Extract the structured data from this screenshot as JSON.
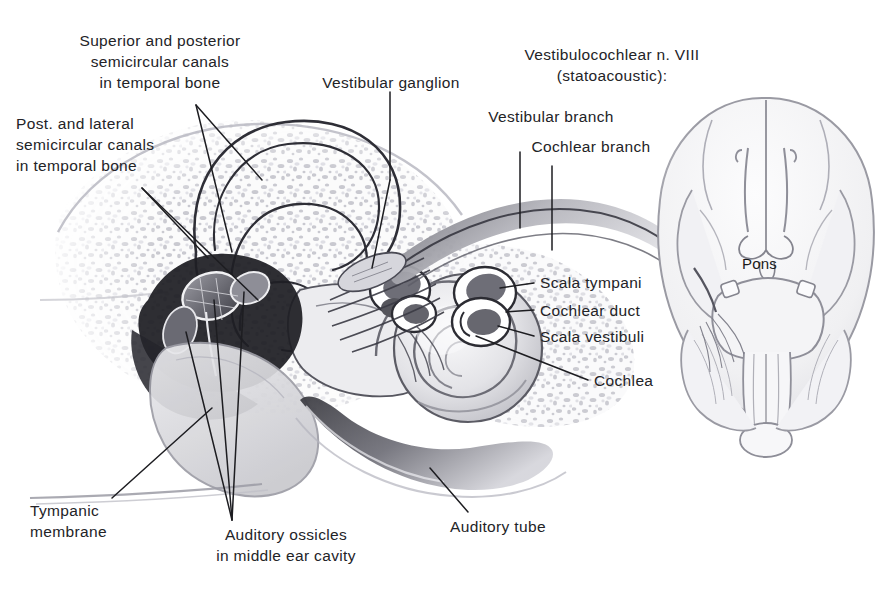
{
  "figure": {
    "background_color": "#ffffff",
    "ink_color": "#232327",
    "line_color": "#1d1d21"
  },
  "labels": {
    "superior_posterior_canals": "Superior and posterior\nsemicircular canals\nin temporal bone",
    "post_lateral_canals": "Post. and lateral\nsemicircular canals\nin temporal bone",
    "vestibular_ganglion": "Vestibular ganglion",
    "nerve_viii": "Vestibulocochlear n. VIII\n(statoacoustic):",
    "vestibular_branch": "Vestibular branch",
    "cochlear_branch": "Cochlear branch",
    "scala_tympani": "Scala tympani",
    "cochlear_duct": "Cochlear duct",
    "scala_vestibuli": "Scala vestibuli",
    "cochlea": "Cochlea",
    "pons": "Pons",
    "tympanic_membrane": "Tympanic\nmembrane",
    "auditory_ossicles": "Auditory ossicles\nin middle ear cavity",
    "auditory_tube": "Auditory tube"
  }
}
